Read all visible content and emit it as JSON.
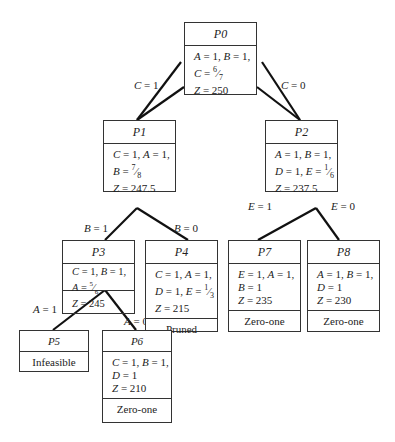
{
  "nodes": {
    "P0": {
      "title": "P0",
      "lines": [
        "A = 1, B = 1,",
        "C = 6/7",
        "Z = 250"
      ],
      "status": ""
    },
    "P1": {
      "title": "P1",
      "lines": [
        "C = 1, A = 1,",
        "B = 7/8",
        "Z = 247.5"
      ],
      "status": ""
    },
    "P2": {
      "title": "P2",
      "lines": [
        "A = 1, B = 1,",
        "D = 1, E = 1/6",
        "Z = 237.5"
      ],
      "status": ""
    },
    "P3": {
      "title": "P3",
      "lines": [
        "C = 1, B = 1,",
        "A = 5/6",
        "Z = 245"
      ],
      "status": ""
    },
    "P4": {
      "title": "P4",
      "lines": [
        "C = 1, A = 1,",
        "D = 1, E = 1/3",
        "Z = 215"
      ],
      "status": "Pruned"
    },
    "P5": {
      "title": "P5",
      "lines": [],
      "status": "Infeasible"
    },
    "P6": {
      "title": "P6",
      "lines": [
        "C = 1, B = 1,",
        "D = 1",
        "Z = 210"
      ],
      "status": "Zero-one"
    },
    "P7": {
      "title": "P7",
      "lines": [
        "E = 1, A = 1,",
        "B = 1",
        "Z = 235"
      ],
      "status": "Zero-one"
    },
    "P8": {
      "title": "P8",
      "lines": [
        "A = 1, B = 1,",
        "D = 1",
        "Z = 230"
      ],
      "status": "Zero-one"
    }
  },
  "edges": {
    "P0_P1": "C = 1",
    "P0_P2": "C = 0",
    "P1_P3": "B = 1",
    "P1_P4": "B = 0",
    "P2_P7": "E = 1",
    "P2_P8": "E = 0",
    "P3_P5": "A = 1",
    "P3_P6": "A = 0"
  }
}
